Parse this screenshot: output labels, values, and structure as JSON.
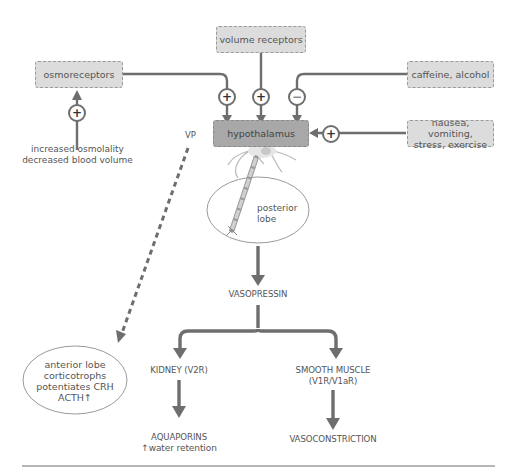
{
  "diagram": {
    "inputs": {
      "osmoreceptors": "osmoreceptors",
      "volume_receptors": "volume receptors",
      "caffeine_alcohol": "caffeine, alcohol",
      "nausea": "nausea, vomiting, stress, exercise"
    },
    "stimulus": {
      "line1": "increased osmolality",
      "line2": "decreased blood volume"
    },
    "hypothalamus": "hypothalamus",
    "vp_label": "VP",
    "posterior_lobe": {
      "line1": "posterior",
      "line2": "lobe"
    },
    "vasopressin": "VASOPRESSIN",
    "anterior": {
      "line1": "anterior lobe",
      "line2": "corticotrophs",
      "line3": "potentiates CRH",
      "line4": "ACTH↑"
    },
    "kidney": "KIDNEY (V2R)",
    "smooth_muscle": {
      "line1": "SMOOTH MUSCLE",
      "line2": "(V1R/V1aR)"
    },
    "aquaporins": {
      "line1": "AQUAPORINS",
      "line2": "↑water retention"
    },
    "vasoconstriction": "VASOCONSTRICTION",
    "signs": {
      "stimulus": "+",
      "osmo": "+",
      "volume": "+",
      "caffeine": "−",
      "nausea": "+"
    },
    "colors": {
      "wire": "#6e6e6e",
      "box": "#dcdcdc",
      "hypothalamus": "#a8a8a8",
      "text": "#555555"
    }
  }
}
